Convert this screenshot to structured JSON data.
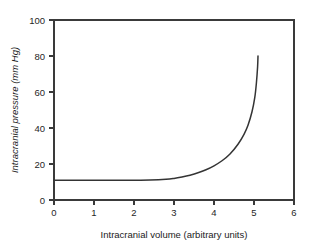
{
  "chart_data": {
    "type": "line",
    "title": "",
    "xlabel": "Intracranial volume (arbitrary units)",
    "ylabel": "Intracranial pressure (mm Hg)",
    "xlim": [
      0,
      6
    ],
    "ylim": [
      0,
      100
    ],
    "xticks": [
      "0",
      "1",
      "2",
      "3",
      "4",
      "5",
      "6"
    ],
    "yticks": [
      "0",
      "20",
      "40",
      "60",
      "80",
      "100"
    ],
    "grid": false,
    "legend": null,
    "series": [
      {
        "name": "Intracranial pressure-volume curve",
        "color": "#343434",
        "x": [
          0.0,
          0.5,
          1.0,
          1.5,
          2.0,
          2.4,
          2.8,
          3.0,
          3.2,
          3.4,
          3.6,
          3.8,
          4.0,
          4.2,
          4.4,
          4.6,
          4.75,
          4.85,
          4.95,
          5.02,
          5.06,
          5.09,
          5.1
        ],
        "y": [
          11.0,
          11.0,
          11.0,
          11.0,
          11.0,
          11.1,
          11.5,
          12.0,
          12.8,
          13.8,
          15.1,
          16.8,
          19.0,
          21.8,
          25.6,
          31.0,
          36.5,
          41.5,
          49.0,
          57.0,
          65.0,
          74.0,
          80.0
        ]
      }
    ],
    "annotations": []
  },
  "axes": {
    "y_title": "Intracranial pressure (mm Hg)",
    "x_title": "Intracranial volume (arbitrary units)"
  }
}
